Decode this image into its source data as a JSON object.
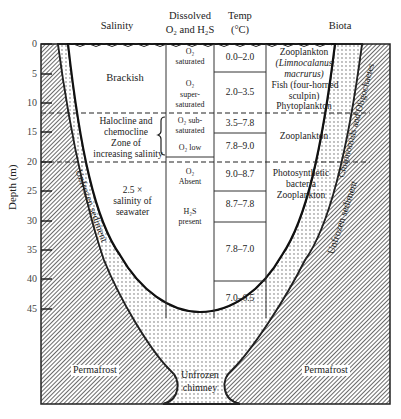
{
  "headers": {
    "salinity": "Salinity",
    "dissolved": "Dissolved",
    "dissolved_line2": "O₂ and H₂S",
    "temp": "Temp",
    "temp_unit": "(°C)",
    "biota": "Biota"
  },
  "axis": {
    "label": "Depth (m)",
    "ticks": [
      "0",
      "5",
      "10",
      "15",
      "20",
      "25",
      "30",
      "35",
      "40",
      "45"
    ]
  },
  "salinity": {
    "brackish": "Brackish",
    "halocline_1": "Halocline and",
    "halocline_2": "chemocline",
    "halocline_3": "Zone of",
    "halocline_4": "increasing salinity",
    "deep_1": "2.5 ×",
    "deep_2": "salinity of",
    "deep_3": "seawater"
  },
  "oxygen": {
    "c1_a": "O₂",
    "c1_b": "saturated",
    "c2_a": "O₂",
    "c2_b": "super-",
    "c2_c": "saturated",
    "c3_a": "O₂ sub-",
    "c3_b": "saturated",
    "c4": "O₂ low",
    "c5_a": "O₂",
    "c5_b": "Absent",
    "c6_a": "H₂S",
    "c6_b": "present"
  },
  "temperature": [
    "0.0–2.0",
    "2.0–3.5",
    "3.5–7.8",
    "7.8–9.0",
    "9.0–8.7",
    "8.7–7.8",
    "7.8–7.0",
    "7.0–6.5"
  ],
  "biota": {
    "b1": "Zooplankton",
    "b2": "(Limnocalanus",
    "b3": "macrurus)",
    "b4": "Fish (four-horned",
    "b5": "sculpin)",
    "b6": "Phytoplankton",
    "b7": "Zooplankton",
    "b8": "Photosynthetic",
    "b9": "bacteria",
    "b10": "Zooplankton"
  },
  "sediment": {
    "left": "Unfrozen sediment",
    "right": "Unfrozen sediment",
    "chironomids": "Chironomids and Oligochaetes"
  },
  "bottom": {
    "permafrost_left": "Permafrost",
    "permafrost_right": "Permafrost",
    "chimney_1": "Unfrozen",
    "chimney_2": "chimney"
  }
}
